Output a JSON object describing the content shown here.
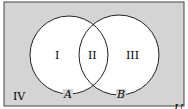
{
  "diagram": {
    "type": "venn",
    "universe_label": "U",
    "sets": [
      {
        "label": "A"
      },
      {
        "label": "B"
      }
    ],
    "regions": [
      {
        "label": "I"
      },
      {
        "label": "II"
      },
      {
        "label": "III"
      },
      {
        "label": "IV"
      }
    ],
    "colors": {
      "universe_fill": "#d4d4d4",
      "circle_fill": "#ffffff",
      "stroke": "#222222"
    }
  }
}
